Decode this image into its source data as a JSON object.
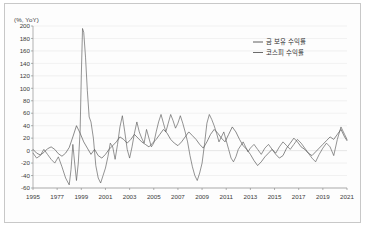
{
  "chart_data": {
    "type": "line",
    "title": "",
    "subtitle": "",
    "xlabel": "",
    "ylabel": "(%, YoY)",
    "ylim": [
      -60,
      200
    ],
    "ytick_step": 20,
    "yticks": [
      200,
      180,
      160,
      140,
      120,
      100,
      80,
      60,
      40,
      20,
      0,
      -20,
      -40,
      -60
    ],
    "xlim": [
      1995,
      2021
    ],
    "xticks": [
      1995,
      1977,
      1999,
      2001,
      2003,
      2005,
      2007,
      2009,
      2011,
      2013,
      2015,
      2017,
      2019,
      2021
    ],
    "xticks_note": "second label printed as 1977 in source (1997)",
    "grid": "horizontal",
    "legend_position": "top-right",
    "colors": {
      "gold": "#4c4c4c",
      "kospi": "#5a5a5a",
      "grid": "#e4e4e4",
      "axis": "#8f8f8f"
    },
    "series": [
      {
        "name": "금 보유 수익률",
        "key": "gold",
        "x": [
          1995.0,
          1995.3,
          1995.6,
          1995.9,
          1996.2,
          1996.5,
          1996.8,
          1997.1,
          1997.4,
          1997.7,
          1998.0,
          1998.3,
          1998.6,
          1998.9,
          1999.2,
          1999.5,
          1999.8,
          2000.1,
          2000.4,
          2000.7,
          2001.0,
          2001.3,
          2001.6,
          2001.9,
          2002.2,
          2002.5,
          2002.8,
          2003.1,
          2003.4,
          2003.7,
          2004.0,
          2004.3,
          2004.6,
          2004.9,
          2005.2,
          2005.5,
          2005.8,
          2006.1,
          2006.4,
          2006.7,
          2007.0,
          2007.3,
          2007.6,
          2007.9,
          2008.2,
          2008.5,
          2008.8,
          2009.1,
          2009.4,
          2009.7,
          2010.0,
          2010.3,
          2010.6,
          2010.9,
          2011.2,
          2011.5,
          2011.8,
          2012.1,
          2012.4,
          2012.7,
          2013.0,
          2013.3,
          2013.6,
          2013.9,
          2014.2,
          2014.5,
          2014.8,
          2015.1,
          2015.4,
          2015.7,
          2016.0,
          2016.3,
          2016.6,
          2016.9,
          2017.2,
          2017.5,
          2017.8,
          2018.1,
          2018.4,
          2018.7,
          2019.0,
          2019.3,
          2019.6,
          2019.9,
          2020.2,
          2020.5,
          2020.8,
          2021.0
        ],
        "values": [
          2,
          -4,
          -7,
          -3,
          3,
          6,
          2,
          -5,
          -9,
          -4,
          5,
          22,
          40,
          28,
          14,
          4,
          -6,
          2,
          -8,
          -12,
          -6,
          2,
          8,
          14,
          22,
          18,
          12,
          18,
          26,
          20,
          14,
          10,
          6,
          12,
          18,
          26,
          34,
          28,
          18,
          12,
          8,
          14,
          22,
          30,
          24,
          18,
          10,
          4,
          14,
          26,
          34,
          28,
          20,
          14,
          26,
          38,
          30,
          18,
          8,
          2,
          -6,
          -16,
          -24,
          -18,
          -10,
          -4,
          2,
          -6,
          -12,
          -8,
          4,
          12,
          20,
          14,
          6,
          2,
          -4,
          -8,
          -2,
          4,
          10,
          16,
          22,
          18,
          26,
          34,
          22,
          16
        ]
      },
      {
        "name": "코스피 수익률",
        "key": "kospi",
        "x": [
          1995.0,
          1995.3,
          1995.6,
          1995.9,
          1996.2,
          1996.5,
          1996.8,
          1997.1,
          1997.4,
          1997.7,
          1998.0,
          1998.15,
          1998.3,
          1998.45,
          1998.6,
          1998.75,
          1998.9,
          1999.0,
          1999.1,
          1999.2,
          1999.35,
          1999.5,
          1999.65,
          1999.8,
          2000.0,
          2000.2,
          2000.4,
          2000.6,
          2000.8,
          2001.0,
          2001.2,
          2001.4,
          2001.6,
          2001.8,
          2002.0,
          2002.2,
          2002.4,
          2002.6,
          2002.8,
          2003.0,
          2003.2,
          2003.4,
          2003.6,
          2003.8,
          2004.0,
          2004.2,
          2004.4,
          2004.6,
          2004.8,
          2005.0,
          2005.2,
          2005.4,
          2005.6,
          2005.8,
          2006.0,
          2006.2,
          2006.4,
          2006.6,
          2006.8,
          2007.0,
          2007.2,
          2007.4,
          2007.6,
          2007.8,
          2008.0,
          2008.2,
          2008.4,
          2008.6,
          2008.8,
          2009.0,
          2009.2,
          2009.4,
          2009.6,
          2009.8,
          2010.0,
          2010.2,
          2010.4,
          2010.6,
          2010.8,
          2011.0,
          2011.2,
          2011.4,
          2011.6,
          2011.8,
          2012.0,
          2012.2,
          2012.4,
          2012.6,
          2012.8,
          2013.0,
          2013.3,
          2013.6,
          2013.9,
          2014.2,
          2014.5,
          2014.8,
          2015.1,
          2015.4,
          2015.7,
          2016.0,
          2016.3,
          2016.6,
          2016.9,
          2017.2,
          2017.5,
          2017.8,
          2018.1,
          2018.4,
          2018.7,
          2019.0,
          2019.3,
          2019.6,
          2019.9,
          2020.2,
          2020.5,
          2020.8,
          2021.0
        ],
        "values": [
          -4,
          -12,
          -8,
          2,
          -6,
          -14,
          -20,
          -10,
          -26,
          -44,
          -55,
          -30,
          10,
          -20,
          -48,
          -20,
          30,
          120,
          196,
          190,
          150,
          96,
          54,
          46,
          20,
          -24,
          -44,
          -52,
          -40,
          -28,
          -10,
          12,
          6,
          -14,
          10,
          38,
          56,
          30,
          2,
          -12,
          6,
          28,
          46,
          30,
          20,
          12,
          34,
          20,
          6,
          12,
          30,
          46,
          58,
          44,
          30,
          44,
          58,
          48,
          36,
          44,
          56,
          44,
          30,
          14,
          -8,
          -26,
          -40,
          -48,
          -36,
          -20,
          10,
          44,
          58,
          50,
          40,
          28,
          14,
          22,
          30,
          16,
          2,
          -12,
          -18,
          -10,
          2,
          8,
          14,
          6,
          -2,
          4,
          10,
          2,
          -6,
          4,
          10,
          2,
          -4,
          6,
          14,
          8,
          2,
          10,
          18,
          12,
          4,
          -4,
          -12,
          -18,
          -6,
          4,
          12,
          6,
          -8,
          18,
          38,
          26,
          18
        ]
      }
    ]
  },
  "legend": {
    "items": [
      {
        "label": "금 보유 수익률",
        "key": "gold"
      },
      {
        "label": "코스피 수익률",
        "key": "kospi"
      }
    ]
  }
}
